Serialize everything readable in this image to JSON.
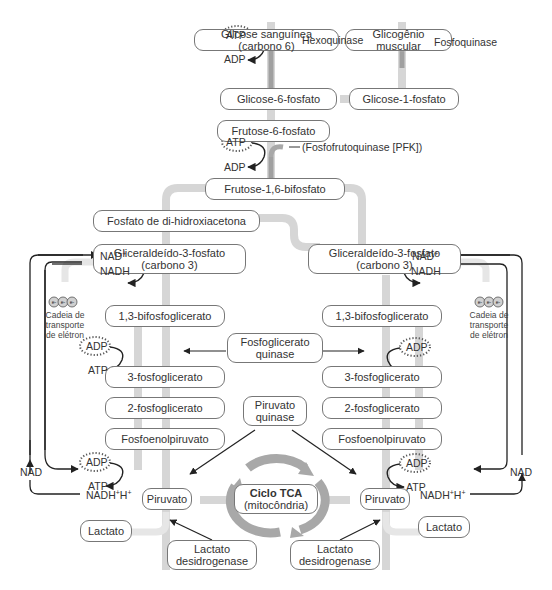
{
  "diagram": {
    "nodes": {
      "glicose_sanguinea": "Glicose sanguínea (carbono 6)",
      "glicogenio_muscular": "Glicogênio muscular",
      "glicose_6_fosfato": "Glicose-6-fosfato",
      "glicose_1_fosfato": "Glicose-1-fosfato",
      "frutose_6_fosfato": "Frutose-6-fosfato",
      "frutose_1_6_bifosfato": "Frutose-1,6-bifosfato",
      "fosfato_dihidroxiacetona": "Fosfato de di-hidroxiacetona",
      "gliceraldeido_left_line1": "Gliceraldeído-3-fosfato",
      "gliceraldeido_left_line2": "(carbono 3)",
      "gliceraldeido_right_line1": "Gliceraldeído-3-fosfato",
      "gliceraldeido_right_line2": "(carbono 3)",
      "bifosfoglicerato_left": "1,3-bifosfoglicerato",
      "bifosfoglicerato_right": "1,3-bifosfoglicerato",
      "fosfoglicerato_quinase_line1": "Fosfoglicerato",
      "fosfoglicerato_quinase_line2": "quinase",
      "tres_fosfoglicerato_left": "3-fosfoglicerato",
      "tres_fosfoglicerato_right": "3-fosfoglicerato",
      "dois_fosfoglicerato_left": "2-fosfoglicerato",
      "dois_fosfoglicerato_right": "2-fosfoglicerato",
      "piruvato_quinase_line1": "Piruvato",
      "piruvato_quinase_line2": "quinase",
      "fosfoenolpiruvato_left": "Fosfoenolpiruvato",
      "fosfoenolpiruvato_right": "Fosfoenolpiruvato",
      "piruvato_left": "Piruvato",
      "piruvato_right": "Piruvato",
      "ciclo_tca_line1": "Ciclo TCA",
      "ciclo_tca_line2": "(mitocôndria)",
      "lactato_left": "Lactato",
      "lactato_right": "Lactato",
      "lactato_desidrogenase_left_line1": "Lactato",
      "lactato_desidrogenase_left_line2": "desidrogenase",
      "lactato_desidrogenase_right_line1": "Lactato",
      "lactato_desidrogenase_right_line2": "desidrogenase"
    },
    "enzymes": {
      "hexoquinase": "Hexoquinase",
      "fosfoquinase": "Fosfoquinase",
      "pfk": "(Fosfofrutoquinase [PFK])"
    },
    "cofactors": {
      "atp": "ATP",
      "adp": "ADP",
      "nad_plus": "NAD",
      "nadh": "NADH",
      "nadh_h": "NADH",
      "h": "H",
      "nad": "NAD",
      "plus": "+",
      "electron": "e-"
    },
    "etc_label": {
      "line1": "Cadeia de",
      "line2": "transporte",
      "line3": "de elétron"
    },
    "colors": {
      "pathway_gray": "#d4d4d4",
      "pathway_dark": "#9a9a9a",
      "arrow": "#222222",
      "box_border": "#777777",
      "tca_cycle": "#a6a6a6"
    }
  }
}
